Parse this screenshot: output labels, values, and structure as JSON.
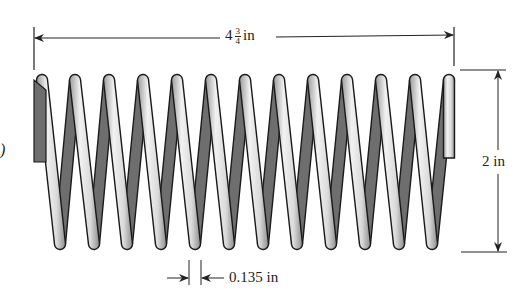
{
  "figure": {
    "dimensions": {
      "length": {
        "whole": "4",
        "numerator": "3",
        "denominator": "4",
        "unit": "in"
      },
      "diameter": {
        "value": "2",
        "unit": "in",
        "text": "2 in"
      },
      "wire_thickness": {
        "value": "0.135",
        "unit": "in",
        "text": "0.135 in"
      }
    },
    "left_edge_fragment": ")",
    "coil": {
      "top_cap_x": [
        42,
        75,
        109,
        143,
        177,
        211,
        245,
        279,
        313,
        347,
        381,
        415
      ],
      "bottom_cap_x": [
        60,
        94,
        127,
        161,
        195,
        229,
        263,
        297,
        331,
        365,
        399,
        432
      ],
      "top_y": 80,
      "bottom_y": 244,
      "end_bar_x": 449,
      "end_bar_bottom_y": 158,
      "left_stub_bottom_y": 162
    },
    "colors": {
      "wire_light": "#e4e4e4",
      "wire_shadow": "#a8a8a8",
      "back_strand": "#6e6e6e",
      "outline": "#1a1a1a",
      "dimension_line": "#222222"
    }
  }
}
